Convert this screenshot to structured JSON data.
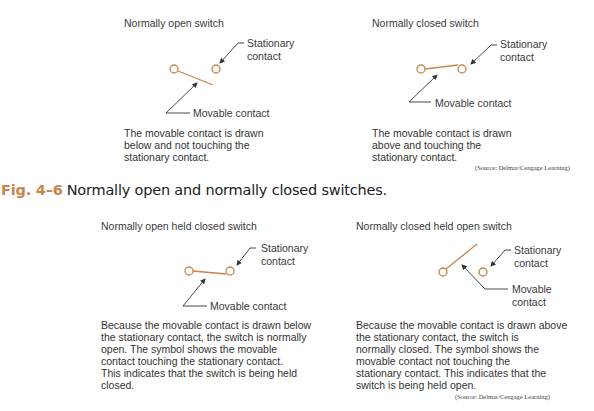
{
  "figure": {
    "caption_label": "Fig. 4–6",
    "caption_text": "Normally open and normally closed switches.",
    "accent_color": "#c8864a",
    "contact_color": "#c8864a",
    "source_top": "(Source: Delmar/Cengage Learning)",
    "source_bottom": "(Source: Delmar/Cengage Learning)"
  },
  "panels": [
    {
      "title": "Normally open switch",
      "stationary_label_1": "Stationary",
      "stationary_label_2": "contact",
      "movable_label": "Movable contact",
      "desc": [
        "The movable contact is drawn",
        "below and not touching the",
        "stationary contact."
      ]
    },
    {
      "title": "Normally closed switch",
      "stationary_label_1": "Stationary",
      "stationary_label_2": "contact",
      "movable_label": "Movable contact",
      "desc": [
        "The movable contact is drawn",
        "above and touching the",
        "stationary contact."
      ]
    },
    {
      "title": "Normally open held closed switch",
      "stationary_label_1": "Stationary",
      "stationary_label_2": "contact",
      "movable_label": "Movable contact",
      "desc": [
        "Because the movable contact is drawn below",
        "the stationary contact, the switch is normally",
        "open. The symbol shows the movable",
        "contact touching the stationary contact.",
        "This indicates that the switch is being held",
        "closed."
      ]
    },
    {
      "title": "Normally closed held open switch",
      "stationary_label_1": "Stationary",
      "stationary_label_2": "contact",
      "movable_label_1": "Movable",
      "movable_label_2": "contact",
      "desc": [
        "Because the movable contact is drawn above",
        "the stationary contact, the switch is",
        "normally closed. The symbol shows the",
        "movable contact not touching the",
        "stationary contact. This indicates that the",
        "switch is being held open."
      ]
    }
  ]
}
